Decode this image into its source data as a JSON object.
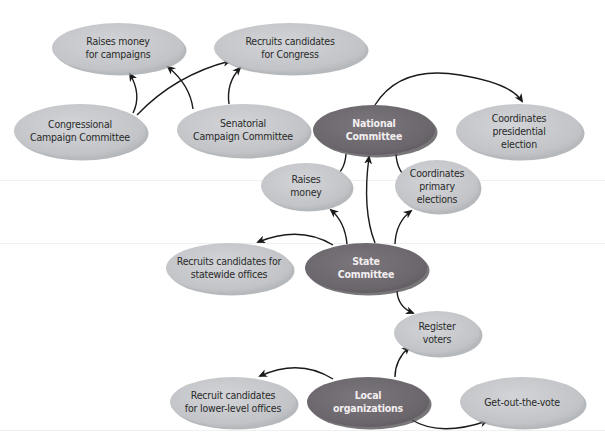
{
  "diagram": {
    "type": "flow",
    "colors": {
      "light_fill": "#c4c6c9",
      "light_shadow": "#9ea1a5",
      "dark_fill": "#6e6a70",
      "dark_shadow": "#4c484e",
      "arrow": "#1a1a1a",
      "background": "#ffffff"
    },
    "nodes": [
      {
        "id": "raises-money-campaigns",
        "label_lines": [
          "Raises money",
          "for campaigns"
        ],
        "style": "light",
        "cx": 118,
        "cy": 48,
        "rx": 66,
        "ry": 25
      },
      {
        "id": "recruits-candidates-congress",
        "label_lines": [
          "Recruits candidates",
          "for Congress"
        ],
        "style": "light",
        "cx": 290,
        "cy": 48,
        "rx": 76,
        "ry": 25
      },
      {
        "id": "congressional-campaign-committee",
        "label_lines": [
          "Congressional",
          "Campaign Committee"
        ],
        "style": "light",
        "cx": 80,
        "cy": 131,
        "rx": 66,
        "ry": 27
      },
      {
        "id": "senatorial-campaign-committee",
        "label_lines": [
          "Senatorial",
          "Campaign Committee"
        ],
        "style": "light",
        "cx": 243,
        "cy": 130,
        "rx": 66,
        "ry": 26
      },
      {
        "id": "national-committee",
        "label_lines": [
          "National",
          "Committee"
        ],
        "style": "dark",
        "cx": 374,
        "cy": 130,
        "rx": 61,
        "ry": 25
      },
      {
        "id": "coordinates-presidential-election",
        "label_lines": [
          "Coordinates",
          "presidential",
          "election"
        ],
        "style": "light",
        "cx": 519,
        "cy": 131,
        "rx": 63,
        "ry": 27
      },
      {
        "id": "raises-money",
        "label_lines": [
          "Raises",
          "money"
        ],
        "style": "light",
        "cx": 306,
        "cy": 186,
        "rx": 45,
        "ry": 23
      },
      {
        "id": "coordinates-primary-elections",
        "label_lines": [
          "Coordinates",
          "primary",
          "elections"
        ],
        "style": "light",
        "cx": 437,
        "cy": 186,
        "rx": 42,
        "ry": 26
      },
      {
        "id": "recruits-candidates-statewide",
        "label_lines": [
          "Recruits candidates for",
          "statewide offices"
        ],
        "style": "light",
        "cx": 229,
        "cy": 268,
        "rx": 63,
        "ry": 25
      },
      {
        "id": "state-committee",
        "label_lines": [
          "State",
          "Committee"
        ],
        "style": "dark",
        "cx": 366,
        "cy": 268,
        "rx": 61,
        "ry": 25
      },
      {
        "id": "register-voters",
        "label_lines": [
          "Register",
          "voters"
        ],
        "style": "light",
        "cx": 437,
        "cy": 333,
        "rx": 43,
        "ry": 22
      },
      {
        "id": "recruit-candidates-lower-level",
        "label_lines": [
          "Recruit candidates",
          "for lower-level offices"
        ],
        "style": "light",
        "cx": 233,
        "cy": 402,
        "rx": 63,
        "ry": 25
      },
      {
        "id": "local-organizations",
        "label_lines": [
          "Local",
          "organizations"
        ],
        "style": "dark",
        "cx": 368,
        "cy": 402,
        "rx": 61,
        "ry": 25
      },
      {
        "id": "get-out-the-vote",
        "label_lines": [
          "Get-out-the-vote"
        ],
        "style": "light",
        "cx": 522,
        "cy": 402,
        "rx": 62,
        "ry": 25
      }
    ],
    "edges": [
      {
        "from": "congressional-campaign-committee",
        "to": "raises-money-campaigns",
        "path": "M 133 113 Q 142 95 130 74"
      },
      {
        "from": "congressional-campaign-committee",
        "to": "recruits-candidates-congress",
        "path": "M 137 115 Q 175 75 230 61"
      },
      {
        "from": "senatorial-campaign-committee",
        "to": "raises-money-campaigns",
        "path": "M 193 109 Q 190 85 168 67"
      },
      {
        "from": "senatorial-campaign-committee",
        "to": "recruits-candidates-congress",
        "path": "M 229 104 Q 226 83 240 68"
      },
      {
        "from": "national-committee",
        "to": "coordinates-presidential-election",
        "path": "M 375 105 Q 400 65 460 75 Q 510 83 522 101"
      },
      {
        "from": "national-committee",
        "to": "raises-money",
        "path": "M 346 154 Q 345 172 330 181"
      },
      {
        "from": "national-committee",
        "to": "coordinates-primary-elections",
        "path": "M 396 154 Q 397 172 410 181"
      },
      {
        "from": "state-committee",
        "to": "national-committee",
        "path": "M 375 243 Q 362 210 369 157"
      },
      {
        "from": "state-committee",
        "to": "raises-money",
        "path": "M 347 244 Q 345 222 331 210"
      },
      {
        "from": "state-committee",
        "to": "coordinates-primary-elections",
        "path": "M 395 244 Q 396 222 411 211"
      },
      {
        "from": "state-committee",
        "to": "recruits-candidates-statewide",
        "path": "M 333 245 Q 300 225 258 242"
      },
      {
        "from": "state-committee",
        "to": "register-voters",
        "path": "M 397 291 Q 398 307 413 313"
      },
      {
        "from": "local-organizations",
        "to": "register-voters",
        "path": "M 395 377 Q 395 360 409 347"
      },
      {
        "from": "local-organizations",
        "to": "recruit-candidates-lower-level",
        "path": "M 333 379 Q 300 358 260 376"
      },
      {
        "from": "local-organizations",
        "to": "get-out-the-vote",
        "path": "M 412 420 Q 440 437 487 421"
      }
    ]
  }
}
